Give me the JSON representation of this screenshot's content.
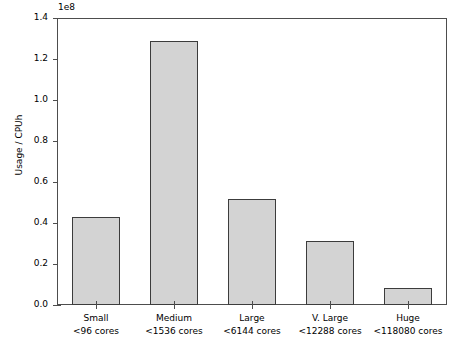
{
  "chart_data": {
    "type": "bar",
    "title": "",
    "xlabel": "",
    "ylabel": "Usage / CPUh",
    "y_offset_text": "1e8",
    "y_offset_multiplier": 100000000,
    "categories": [
      "Small",
      "Medium",
      "Large",
      "V. Large",
      "Huge"
    ],
    "category_sublabels": [
      "<96 cores",
      "<1536 cores",
      "<6144 cores",
      "<12288 cores",
      "<118080 cores"
    ],
    "values": [
      43000000,
      129000000,
      51500000,
      31000000,
      8500000
    ],
    "values_scaled": [
      0.43,
      1.29,
      0.515,
      0.31,
      0.085
    ],
    "ylim": [
      0,
      140000000
    ],
    "ylim_scaled": [
      0.0,
      1.4
    ],
    "ytick_values": [
      0.0,
      0.2,
      0.4,
      0.6,
      0.8,
      1.0,
      1.2,
      1.4
    ],
    "ytick_labels": [
      "0.0",
      "0.2",
      "0.4",
      "0.6",
      "0.8",
      "1.0",
      "1.2",
      "1.4"
    ],
    "grid": false,
    "legend": null,
    "legend_position": "none",
    "bar_color": "#d3d3d3",
    "bar_edge_color": "#3c3c3c",
    "axis_color": "#4d4d4d",
    "background_color": "#ffffff"
  },
  "yticks": [
    {
      "label": "1.4",
      "value": 1.4
    },
    {
      "label": "1.2",
      "value": 1.2
    },
    {
      "label": "1.0",
      "value": 1.0
    },
    {
      "label": "0.8",
      "value": 0.8
    },
    {
      "label": "0.6",
      "value": 0.6
    },
    {
      "label": "0.4",
      "value": 0.4
    },
    {
      "label": "0.2",
      "value": 0.2
    },
    {
      "label": "0.0",
      "value": 0.0
    }
  ],
  "bars": [
    {
      "category": "Small",
      "cores": "<96 cores",
      "value": 0.43
    },
    {
      "category": "Medium",
      "cores": "<1536 cores",
      "value": 1.29
    },
    {
      "category": "Large",
      "cores": "<6144 cores",
      "value": 0.515
    },
    {
      "category": "V. Large",
      "cores": "<12288 cores",
      "value": 0.31
    },
    {
      "category": "Huge",
      "cores": "<118080 cores",
      "value": 0.085
    }
  ]
}
